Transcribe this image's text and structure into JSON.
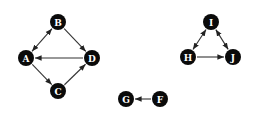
{
  "diagram": {
    "type": "directed-graph",
    "background": "#ffffff",
    "node_color": "#0a0a0a",
    "label_color": "#ffffff",
    "edge_color": "#333333",
    "node_radius": 8,
    "nodes": [
      {
        "id": "A",
        "label": "A",
        "x": 26,
        "y": 58
      },
      {
        "id": "B",
        "label": "B",
        "x": 58,
        "y": 22
      },
      {
        "id": "C",
        "label": "C",
        "x": 58,
        "y": 91
      },
      {
        "id": "D",
        "label": "D",
        "x": 92,
        "y": 58
      },
      {
        "id": "I",
        "label": "I",
        "x": 211,
        "y": 22
      },
      {
        "id": "H",
        "label": "H",
        "x": 188,
        "y": 57
      },
      {
        "id": "J",
        "label": "J",
        "x": 233,
        "y": 57
      },
      {
        "id": "G",
        "label": "G",
        "x": 126,
        "y": 99
      },
      {
        "id": "F",
        "label": "F",
        "x": 160,
        "y": 99
      }
    ],
    "edges": [
      {
        "from": "A",
        "to": "B",
        "bidirectional": true
      },
      {
        "from": "B",
        "to": "D",
        "bidirectional": false
      },
      {
        "from": "D",
        "to": "A",
        "bidirectional": false
      },
      {
        "from": "A",
        "to": "C",
        "bidirectional": false
      },
      {
        "from": "C",
        "to": "D",
        "bidirectional": false
      },
      {
        "from": "H",
        "to": "I",
        "bidirectional": true
      },
      {
        "from": "I",
        "to": "J",
        "bidirectional": true
      },
      {
        "from": "H",
        "to": "J",
        "bidirectional": false
      },
      {
        "from": "F",
        "to": "G",
        "bidirectional": false
      }
    ]
  }
}
